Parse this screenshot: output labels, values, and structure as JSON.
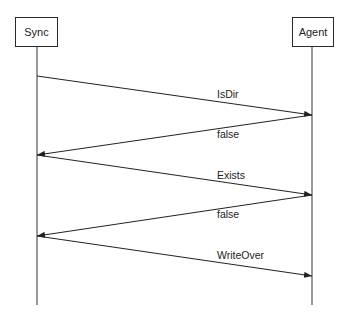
{
  "diagram": {
    "type": "sequence",
    "participants": [
      {
        "id": "sync",
        "label": "Sync"
      },
      {
        "id": "agent",
        "label": "Agent"
      }
    ],
    "messages": [
      {
        "from": "sync",
        "to": "agent",
        "label": "IsDir"
      },
      {
        "from": "agent",
        "to": "sync",
        "label": "false"
      },
      {
        "from": "sync",
        "to": "agent",
        "label": "Exists"
      },
      {
        "from": "agent",
        "to": "sync",
        "label": "false"
      },
      {
        "from": "sync",
        "to": "agent",
        "label": "WriteOver"
      }
    ]
  }
}
